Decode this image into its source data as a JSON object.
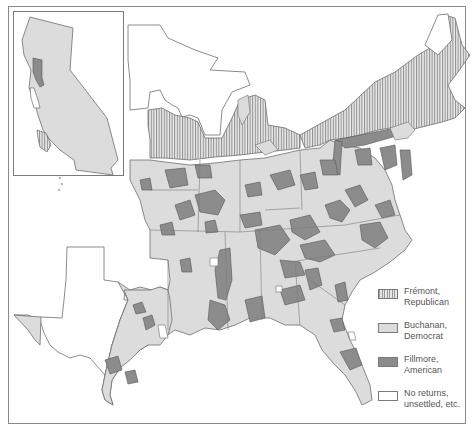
{
  "map": {
    "subject": "1856 U.S. presidential election results by county",
    "inset": "California"
  },
  "legend": {
    "items": [
      {
        "key": "republican",
        "label": "Frémont,\nRepublican",
        "pattern": "vertical-hatch",
        "color": "#e6e6e6"
      },
      {
        "key": "democrat",
        "label": "Buchanan,\nDemocrat",
        "pattern": "solid",
        "color": "#dcdcdc"
      },
      {
        "key": "american",
        "label": "Fillmore,\nAmerican",
        "pattern": "solid",
        "color": "#8c8c8c"
      },
      {
        "key": "none",
        "label": "No returns,\nunsettled, etc.",
        "pattern": "solid",
        "color": "#ffffff"
      }
    ]
  },
  "colors": {
    "border": "#7a7a7a",
    "democrat_fill": "#dcdcdc",
    "american_fill": "#8c8c8c",
    "republican_hatch": "#9a9a9a",
    "background": "#ffffff"
  }
}
